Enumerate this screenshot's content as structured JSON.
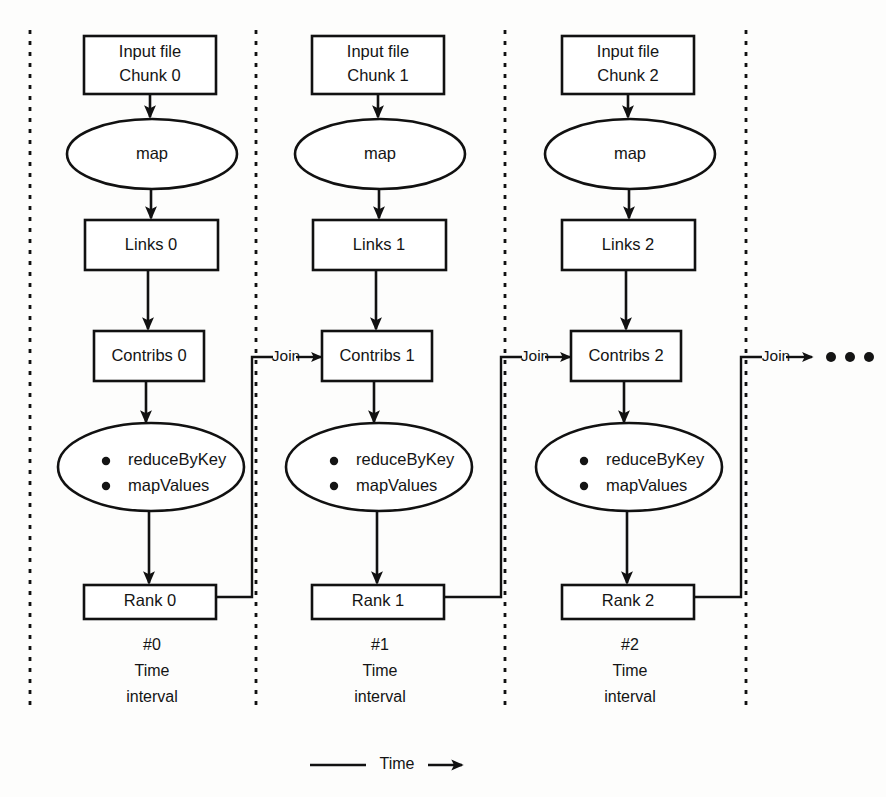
{
  "diagram": {
    "columns": [
      {
        "id": "interval-0",
        "input_label_line1": "Input file",
        "input_label_line2": "Chunk 0",
        "map_label": "map",
        "links_label": "Links 0",
        "contribs_label": "Contribs 0",
        "reduce_label_line1": "reduceByKey",
        "reduce_label_line2": "mapValues",
        "rank_label": "Rank 0",
        "caption_line1": "#0",
        "caption_line2": "Time",
        "caption_line3": "interval"
      },
      {
        "id": "interval-1",
        "input_label_line1": "Input file",
        "input_label_line2": "Chunk 1",
        "map_label": "map",
        "links_label": "Links 1",
        "contribs_label": "Contribs 1",
        "reduce_label_line1": "reduceByKey",
        "reduce_label_line2": "mapValues",
        "rank_label": "Rank 1",
        "caption_line1": "#1",
        "caption_line2": "Time",
        "caption_line3": "interval"
      },
      {
        "id": "interval-2",
        "input_label_line1": "Input file",
        "input_label_line2": "Chunk 2",
        "map_label": "map",
        "links_label": "Links 2",
        "contribs_label": "Contribs 2",
        "reduce_label_line1": "reduceByKey",
        "reduce_label_line2": "mapValues",
        "rank_label": "Rank 2",
        "caption_line1": "#2",
        "caption_line2": "Time",
        "caption_line3": "interval"
      }
    ],
    "join_labels": [
      "Join",
      "Join",
      "Join"
    ],
    "continuation_marker": "…",
    "time_axis_label": "Time",
    "colors": {
      "stroke": "#111111",
      "fill": "#ffffff",
      "text": "#141414",
      "background": "#fdfdfc"
    }
  }
}
